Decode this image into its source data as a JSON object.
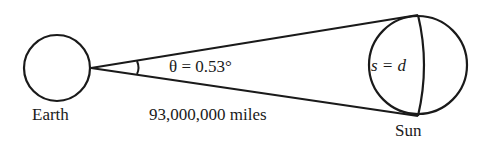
{
  "diagram": {
    "earth_label": "Earth",
    "sun_label": "Sun",
    "angle_label": "θ = 0.53°",
    "distance_label": "93,000,000 miles",
    "arc_label": "s = d",
    "stroke_color": "#1a1a1a"
  }
}
